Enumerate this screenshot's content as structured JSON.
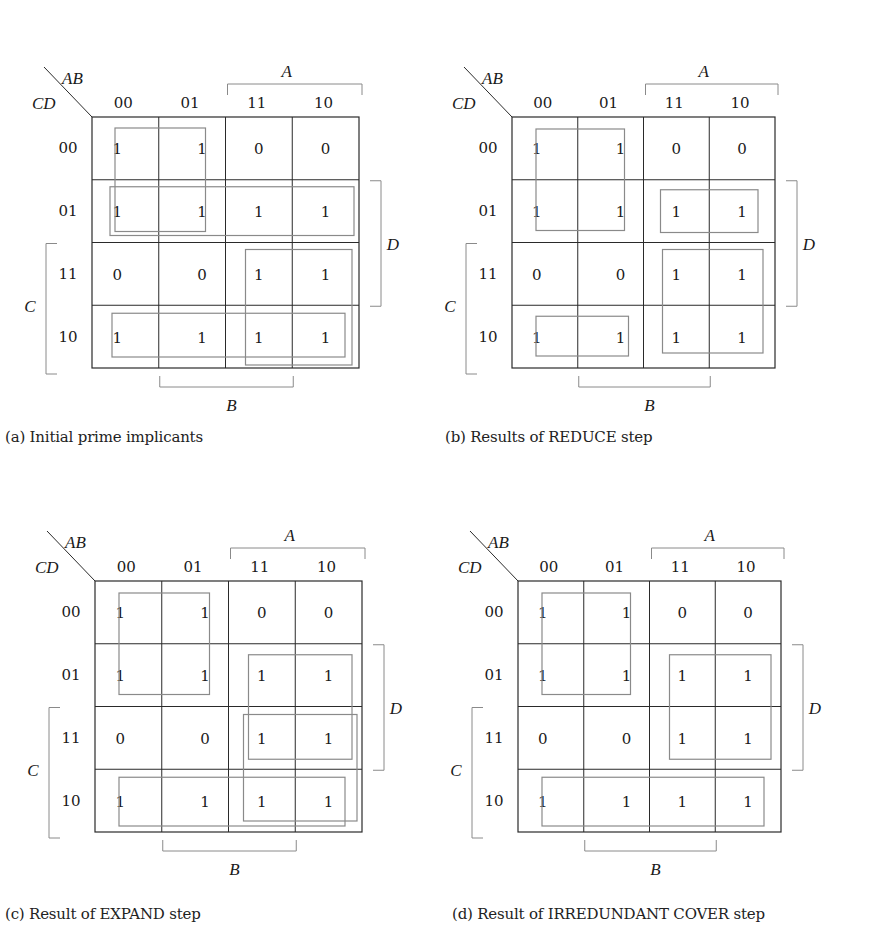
{
  "figure": {
    "maps": [
      {
        "id": "a",
        "caption": "(a) Initial prime implicants",
        "origin": [
          92,
          117
        ],
        "size": [
          267,
          251
        ],
        "caption_pos": [
          5,
          428
        ],
        "corner_labels": {
          "row_var": "CD",
          "col_var": "AB"
        },
        "col_headers": [
          "00",
          "01",
          "11",
          "10"
        ],
        "row_headers": [
          "00",
          "01",
          "11",
          "10"
        ],
        "bracket_labels": {
          "A": "A",
          "B": "B",
          "C": "C",
          "D": "D"
        },
        "cells": [
          [
            "1",
            "1",
            "0",
            "0"
          ],
          [
            "1",
            "1",
            "1",
            "1"
          ],
          [
            "0",
            "0",
            "1",
            "1"
          ],
          [
            "1",
            "1",
            "1",
            "1"
          ]
        ],
        "implicants": [
          {
            "name": "A'C'",
            "rows": [
              0,
              1
            ],
            "cols": [
              0,
              1
            ],
            "inset": [
              23,
              11,
              20,
              11
            ]
          },
          {
            "name": "C'D",
            "rows": [
              1,
              1
            ],
            "cols": [
              0,
              3
            ],
            "inset": [
              18,
              7,
              5,
              7
            ]
          },
          {
            "name": "AC",
            "rows": [
              2,
              3
            ],
            "cols": [
              2,
              3
            ],
            "inset": [
              20,
              7,
              7,
              3
            ]
          },
          {
            "name": "CD'",
            "rows": [
              3,
              3
            ],
            "cols": [
              0,
              3
            ],
            "inset": [
              20,
              8,
              14,
              11
            ]
          }
        ]
      },
      {
        "id": "b",
        "caption": "(b) Results of REDUCE step",
        "origin": [
          512,
          117
        ],
        "size": [
          263,
          251
        ],
        "caption_pos": [
          445,
          428
        ],
        "corner_labels": {
          "row_var": "CD",
          "col_var": "AB"
        },
        "col_headers": [
          "00",
          "01",
          "11",
          "10"
        ],
        "row_headers": [
          "00",
          "01",
          "11",
          "10"
        ],
        "bracket_labels": {
          "A": "A",
          "B": "B",
          "C": "C",
          "D": "D"
        },
        "cells": [
          [
            "1",
            "1",
            "0",
            "0"
          ],
          [
            "1",
            "1",
            "0",
            "0"
          ],
          [
            "0",
            "0",
            "1",
            "1"
          ],
          [
            "1",
            "1",
            "1",
            "1"
          ]
        ],
        "display_cells": [
          [
            "1",
            "1",
            "0",
            "0"
          ],
          [
            "1",
            "1",
            "1",
            "1"
          ],
          [
            "0",
            "0",
            "1",
            "1"
          ],
          [
            "1",
            "1",
            "1",
            "1"
          ]
        ],
        "implicants": [
          {
            "name": "A'C'",
            "rows": [
              0,
              1
            ],
            "cols": [
              0,
              1
            ],
            "inset": [
              24,
              12,
              19,
              12
            ]
          },
          {
            "name": "AC'D",
            "rows": [
              1,
              1
            ],
            "cols": [
              2,
              3
            ],
            "inset": [
              17,
              10,
              17,
              10
            ]
          },
          {
            "name": "AC",
            "rows": [
              2,
              3
            ],
            "cols": [
              2,
              3
            ],
            "inset": [
              19,
              7,
              12,
              15
            ]
          },
          {
            "name": "A'CD'",
            "rows": [
              3,
              3
            ],
            "cols": [
              0,
              1
            ],
            "inset": [
              24,
              11,
              15,
              12
            ]
          }
        ]
      },
      {
        "id": "c",
        "caption": "(c) Result of EXPAND step",
        "origin": [
          95,
          581
        ],
        "size": [
          267,
          251
        ],
        "caption_pos": [
          5,
          905
        ],
        "corner_labels": {
          "row_var": "CD",
          "col_var": "AB"
        },
        "col_headers": [
          "00",
          "01",
          "11",
          "10"
        ],
        "row_headers": [
          "00",
          "01",
          "11",
          "10"
        ],
        "bracket_labels": {
          "A": "A",
          "B": "B",
          "C": "C",
          "D": "D"
        },
        "display_cells": [
          [
            "1",
            "1",
            "0",
            "0"
          ],
          [
            "1",
            "1",
            "1",
            "1"
          ],
          [
            "0",
            "0",
            "1",
            "1"
          ],
          [
            "1",
            "1",
            "1",
            "1"
          ]
        ],
        "implicants": [
          {
            "name": "A'C'",
            "rows": [
              0,
              1
            ],
            "cols": [
              0,
              1
            ],
            "inset": [
              24,
              12,
              19,
              12
            ]
          },
          {
            "name": "AD",
            "rows": [
              1,
              2
            ],
            "cols": [
              2,
              3
            ],
            "inset": [
              20,
              11,
              10,
              10
            ]
          },
          {
            "name": "AC",
            "rows": [
              2,
              3
            ],
            "cols": [
              2,
              3
            ],
            "inset": [
              15,
              8,
              5,
              11
            ]
          },
          {
            "name": "CD'",
            "rows": [
              3,
              3
            ],
            "cols": [
              0,
              3
            ],
            "inset": [
              24,
              8,
              17,
              6
            ]
          }
        ]
      },
      {
        "id": "d",
        "caption": "(d) Result of IRREDUNDANT COVER step",
        "origin": [
          518,
          581
        ],
        "size": [
          263,
          251
        ],
        "caption_pos": [
          452,
          905
        ],
        "corner_labels": {
          "row_var": "CD",
          "col_var": "AB"
        },
        "col_headers": [
          "00",
          "01",
          "11",
          "10"
        ],
        "row_headers": [
          "00",
          "01",
          "11",
          "10"
        ],
        "bracket_labels": {
          "A": "A",
          "B": "B",
          "C": "C",
          "D": "D"
        },
        "display_cells": [
          [
            "1",
            "1",
            "0",
            "0"
          ],
          [
            "1",
            "1",
            "1",
            "1"
          ],
          [
            "0",
            "0",
            "1",
            "1"
          ],
          [
            "1",
            "1",
            "1",
            "1"
          ]
        ],
        "implicants": [
          {
            "name": "A'C'",
            "rows": [
              0,
              1
            ],
            "cols": [
              0,
              1
            ],
            "inset": [
              24,
              12,
              19,
              12
            ]
          },
          {
            "name": "AD",
            "rows": [
              1,
              2
            ],
            "cols": [
              2,
              3
            ],
            "inset": [
              20,
              11,
              10,
              10
            ]
          },
          {
            "name": "CD'",
            "rows": [
              3,
              3
            ],
            "cols": [
              0,
              3
            ],
            "inset": [
              24,
              8,
              17,
              6
            ]
          }
        ]
      }
    ],
    "colors": {
      "grid": "#2a2a2a",
      "implicant": "#8a8a8a",
      "bracket": "#8a8a8a",
      "text": "#1a1a1a"
    }
  }
}
